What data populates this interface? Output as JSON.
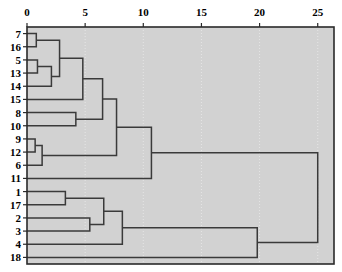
{
  "chart_data": {
    "type": "dendrogram",
    "title": "",
    "xlabel": "",
    "ylabel": "",
    "orientation": "horizontal",
    "xlim": [
      0,
      26.4
    ],
    "ylim": [
      0,
      18
    ],
    "grid": true,
    "grid_axis": "x",
    "xticks": [
      0,
      5,
      10,
      15,
      20,
      25
    ],
    "xtick_labels": [
      "0",
      "5",
      "10",
      "15",
      "20",
      "25"
    ],
    "leaf_labels": [
      "7",
      "16",
      "5",
      "13",
      "14",
      "15",
      "8",
      "10",
      "9",
      "12",
      "6",
      "11",
      "1",
      "17",
      "2",
      "3",
      "4",
      "18"
    ],
    "leaf_order": [
      7,
      16,
      5,
      13,
      14,
      15,
      8,
      10,
      9,
      12,
      6,
      11,
      1,
      17,
      2,
      3,
      4,
      18
    ],
    "merges": [
      {
        "id": "m1",
        "left": "7",
        "right": "16",
        "height": 0.8,
        "rows": [
          0,
          1
        ]
      },
      {
        "id": "m2",
        "left": "5",
        "right": "13",
        "height": 0.9,
        "rows": [
          2,
          3
        ]
      },
      {
        "id": "m3",
        "left": "9",
        "right": "12",
        "height": 0.7,
        "rows": [
          8,
          9
        ]
      },
      {
        "id": "m4",
        "left": "m3",
        "right": "6",
        "height": 1.3,
        "rows": [
          8.5,
          10
        ]
      },
      {
        "id": "m5",
        "left": "m2",
        "right": "14",
        "height": 2.1,
        "rows": [
          2.5,
          4
        ]
      },
      {
        "id": "m6",
        "left": "m1",
        "right": "m5",
        "height": 2.8,
        "rows": [
          0.5,
          3.25
        ]
      },
      {
        "id": "m7",
        "left": "1",
        "right": "17",
        "height": 3.3,
        "rows": [
          12,
          13
        ]
      },
      {
        "id": "m8",
        "left": "m6",
        "right": "15",
        "height": 4.8,
        "rows": [
          1.875,
          5
        ]
      },
      {
        "id": "m9",
        "left": "2",
        "right": "3",
        "height": 5.4,
        "rows": [
          14,
          15
        ]
      },
      {
        "id": "m10",
        "left": "8",
        "right": "10",
        "height": 4.2,
        "rows": [
          6,
          7
        ]
      },
      {
        "id": "m11",
        "left": "m7",
        "right": "m9",
        "height": 6.6,
        "rows": [
          12.5,
          14.5
        ]
      },
      {
        "id": "m12",
        "left": "m8",
        "right": "m10",
        "height": 6.5,
        "rows": [
          3.4375,
          6.5
        ]
      },
      {
        "id": "m13",
        "left": "m12",
        "right": "m4",
        "height": 7.7,
        "rows": [
          4.97,
          9.25
        ]
      },
      {
        "id": "m14",
        "left": "m11",
        "right": "4",
        "height": 8.2,
        "rows": [
          13.5,
          16
        ]
      },
      {
        "id": "m15",
        "left": "m13",
        "right": "11",
        "height": 10.7,
        "rows": [
          7.11,
          11
        ]
      },
      {
        "id": "m16",
        "left": "m14",
        "right": "18",
        "height": 19.8,
        "rows": [
          14.75,
          17
        ]
      },
      {
        "id": "m17",
        "left": "m15",
        "right": "m16",
        "height": 25.0,
        "rows": [
          9.05,
          15.875
        ]
      }
    ],
    "colors": {
      "plot_background": "#d2d2d2",
      "figure_background": "#ffffff",
      "link_line": "#3a3a3a",
      "axis_line": "#2a2a2a",
      "grid_line": "#e6e6e6",
      "tick_text": "#000000"
    },
    "geometry": {
      "plot_left_px": 27,
      "plot_right_px": 334,
      "plot_top_px": 27,
      "plot_bottom_px": 264,
      "x_value_at_left": 0,
      "x_value_at_right": 26.4,
      "leaf_count": 18
    }
  }
}
